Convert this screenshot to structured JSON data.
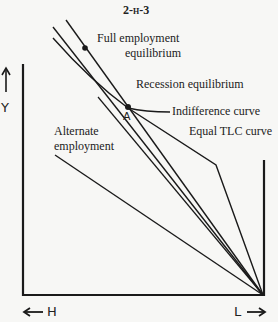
{
  "title": "2-h-3",
  "labels": {
    "full_employment": "Full employment",
    "full_employment_2": "equilibrium",
    "recession": "Recession equilibrium",
    "indifference": "Indifference curve",
    "point_a": "A",
    "alternate": "Alternate",
    "alternate_2": "employment",
    "equal_tlc": "Equal TLC curve"
  },
  "axes": {
    "y_label": "Y",
    "h_label": "H",
    "l_label": "L"
  },
  "colors": {
    "ink": "#1a1a1a",
    "background": "#f7f7f5"
  }
}
